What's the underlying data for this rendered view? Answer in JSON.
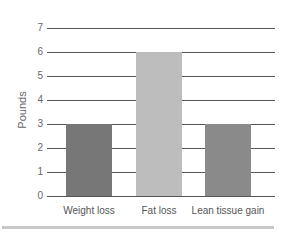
{
  "chart_data": {
    "type": "bar",
    "title": "",
    "xlabel": "",
    "ylabel": "Pounds",
    "categories": [
      "Weight loss",
      "Fat loss",
      "Lean tissue gain"
    ],
    "values": [
      3,
      6,
      3
    ],
    "bar_colors": [
      "#777777",
      "#bdbdbd",
      "#8a8a8a"
    ],
    "ylim": [
      0,
      7
    ],
    "yticks": [
      "0",
      "1",
      "2",
      "3",
      "4",
      "5",
      "6",
      "7"
    ],
    "grid": true,
    "legend": null
  },
  "colors": {
    "gridline": "#555555",
    "bottom_rule": "#c8c8c8"
  }
}
